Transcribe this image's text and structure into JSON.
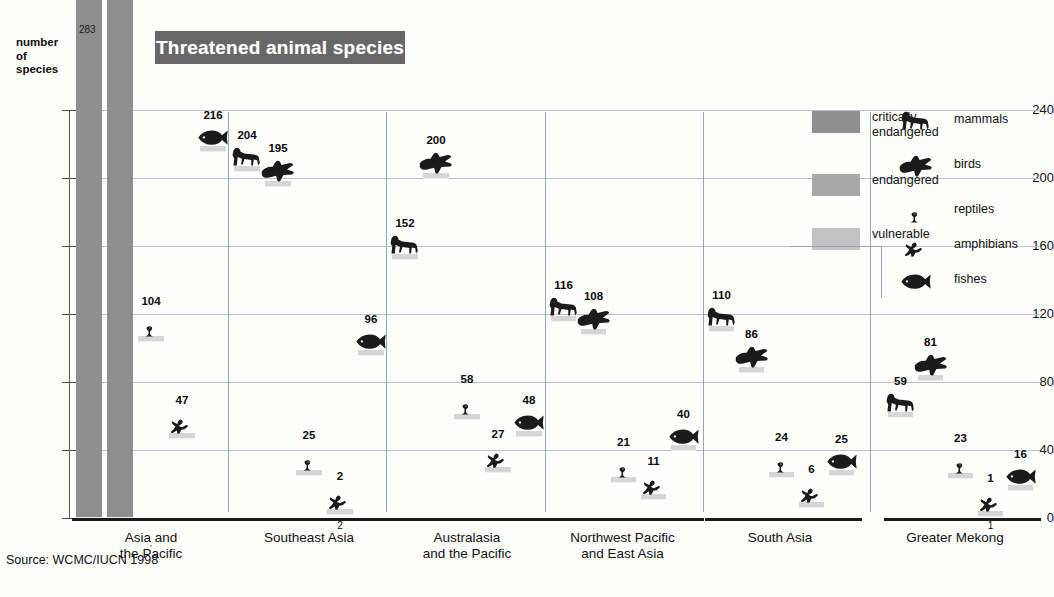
{
  "title": "Threatened animal species",
  "axis": {
    "y_title": "number\nof\nspecies",
    "y_title_lines": [
      "number",
      "of",
      "species"
    ],
    "y_ticks": [
      0,
      40,
      80,
      120,
      160,
      200,
      240
    ],
    "y_min": 0,
    "y_max": 240
  },
  "source": "Source: WCMC/IUCN 1998",
  "legend": {
    "categories": [
      {
        "key": "critically",
        "label": "critically\nendangered",
        "lines": [
          "critically",
          "endangered"
        ],
        "color": "#8e8e8e"
      },
      {
        "key": "endangered",
        "label": "endangered",
        "lines": [
          "endangered"
        ],
        "color": "#a9a9a9"
      },
      {
        "key": "vulnerable",
        "label": "vulnerable",
        "lines": [
          "vulnerable"
        ],
        "color": "#c2c2c2"
      }
    ],
    "taxa": [
      {
        "icon": "mammals-icon",
        "label": "mammals"
      },
      {
        "icon": "birds-icon",
        "label": "birds"
      },
      {
        "icon": "reptiles-icon",
        "label": "reptiles"
      },
      {
        "icon": "amphibians-icon",
        "label": "amphibians"
      },
      {
        "icon": "fishes-icon",
        "label": "fishes"
      }
    ]
  },
  "chart_data": {
    "type": "bar",
    "title": "Threatened animal species",
    "xlabel": "",
    "ylabel": "number of species",
    "ylim": [
      0,
      240
    ],
    "stacked": true,
    "grid": true,
    "legend_position": "right",
    "stack_order_bottom_to_top": [
      "vulnerable",
      "endangered",
      "critically endangered"
    ],
    "series": [
      {
        "name": "critically endangered",
        "color": "#8e8e8e"
      },
      {
        "name": "endangered",
        "color": "#a9a9a9"
      },
      {
        "name": "vulnerable",
        "color": "#c2c2c2"
      }
    ],
    "categories": [
      "Asia and the Pacific",
      "Southeast Asia",
      "Australasia and the Pacific",
      "Northwest Pacific and East Asia",
      "South Asia",
      "Greater Mekong"
    ],
    "taxa": [
      "mammals",
      "birds",
      "reptiles",
      "amphibians",
      "fishes"
    ],
    "groups": [
      {
        "name": "Asia and the Pacific",
        "label_lines": [
          "Asia and",
          "the Pacific"
        ],
        "bars": [
          {
            "taxon": "mammals",
            "total": null,
            "total_label": "",
            "clipped": true,
            "segments": [
              {
                "cat": "critically",
                "value": 283
              }
            ]
          },
          {
            "taxon": "birds",
            "total": null,
            "total_label": "",
            "clipped": true,
            "segments": []
          },
          {
            "taxon": "reptiles",
            "total": 104,
            "total_label": "104",
            "clipped": false,
            "segments": [
              {
                "cat": "critically",
                "value": 13
              },
              {
                "cat": "endangered",
                "value": 24
              },
              {
                "cat": "vulnerable",
                "value": 67
              }
            ]
          },
          {
            "taxon": "amphibians",
            "total": 47,
            "total_label": "47",
            "clipped": false,
            "segments": [
              {
                "cat": "critically",
                "value": 8
              },
              {
                "cat": "endangered",
                "value": 16
              },
              {
                "cat": "vulnerable",
                "value": 23
              }
            ]
          },
          {
            "taxon": "fishes",
            "total": 216,
            "total_label": "216",
            "clipped": false,
            "segments": [
              {
                "cat": "critically",
                "value": 44
              },
              {
                "cat": "endangered",
                "value": 47
              },
              {
                "cat": "vulnerable",
                "value": 125
              }
            ]
          }
        ]
      },
      {
        "name": "Southeast Asia",
        "label_lines": [
          "Southeast Asia"
        ],
        "bars": [
          {
            "taxon": "mammals",
            "total": 204,
            "total_label": "204",
            "clipped": false,
            "segments": [
              {
                "cat": "critically",
                "value": 23
              },
              {
                "cat": "endangered",
                "value": 57
              },
              {
                "cat": "vulnerable",
                "value": 124
              }
            ]
          },
          {
            "taxon": "birds",
            "total": 195,
            "total_label": "195",
            "clipped": false,
            "segments": [
              {
                "cat": "critically",
                "value": 20
              },
              {
                "cat": "endangered",
                "value": 42
              },
              {
                "cat": "vulnerable",
                "value": 133
              }
            ]
          },
          {
            "taxon": "reptiles",
            "total": 25,
            "total_label": "25",
            "clipped": false,
            "segments": [
              {
                "cat": "critically",
                "value": 6
              },
              {
                "cat": "endangered",
                "value": 15
              },
              {
                "cat": "vulnerable",
                "value": 4
              }
            ]
          },
          {
            "taxon": "amphibians",
            "total": 2,
            "total_label": "2",
            "clipped": false,
            "segments": [
              {
                "cat": "vulnerable",
                "value": 2
              }
            ]
          },
          {
            "taxon": "fishes",
            "total": 96,
            "total_label": "96",
            "clipped": false,
            "segments": [
              {
                "cat": "critically",
                "value": 25
              },
              {
                "cat": "endangered",
                "value": 11
              },
              {
                "cat": "vulnerable",
                "value": 60
              }
            ]
          }
        ]
      },
      {
        "name": "Australasia and the Pacific",
        "label_lines": [
          "Australasia",
          "and the Pacific"
        ],
        "bars": [
          {
            "taxon": "mammals",
            "total": 152,
            "total_label": "152",
            "clipped": false,
            "segments": [
              {
                "cat": "critically",
                "value": 23
              },
              {
                "cat": "endangered",
                "value": 40
              },
              {
                "cat": "vulnerable",
                "value": 89
              }
            ]
          },
          {
            "taxon": "birds",
            "total": 200,
            "total_label": "200",
            "clipped": false,
            "segments": [
              {
                "cat": "critically",
                "value": 23
              },
              {
                "cat": "endangered",
                "value": 38
              },
              {
                "cat": "vulnerable",
                "value": 139
              }
            ]
          },
          {
            "taxon": "reptiles",
            "total": 58,
            "total_label": "58",
            "clipped": false,
            "segments": [
              {
                "cat": "critically",
                "value": 4
              },
              {
                "cat": "endangered",
                "value": 12
              },
              {
                "cat": "vulnerable",
                "value": 42
              }
            ]
          },
          {
            "taxon": "amphibians",
            "total": 27,
            "total_label": "27",
            "clipped": false,
            "segments": [
              {
                "cat": "critically",
                "value": 8
              },
              {
                "cat": "endangered",
                "value": 11
              },
              {
                "cat": "vulnerable",
                "value": 8
              }
            ]
          },
          {
            "taxon": "fishes",
            "total": 48,
            "total_label": "48",
            "clipped": false,
            "segments": [
              {
                "cat": "critically",
                "value": 10
              },
              {
                "cat": "endangered",
                "value": 6
              },
              {
                "cat": "vulnerable",
                "value": 32
              }
            ]
          }
        ]
      },
      {
        "name": "Northwest Pacific and East Asia",
        "label_lines": [
          "Northwest Pacific",
          "and East Asia"
        ],
        "bars": [
          {
            "taxon": "mammals",
            "total": 116,
            "total_label": "116",
            "clipped": false,
            "segments": [
              {
                "cat": "critically",
                "value": 9
              },
              {
                "cat": "endangered",
                "value": 44
              },
              {
                "cat": "vulnerable",
                "value": 63
              }
            ]
          },
          {
            "taxon": "birds",
            "total": 108,
            "total_label": "108",
            "clipped": false,
            "segments": [
              {
                "cat": "critically",
                "value": 10
              },
              {
                "cat": "endangered",
                "value": 11
              },
              {
                "cat": "vulnerable",
                "value": 87
              }
            ]
          },
          {
            "taxon": "reptiles",
            "total": 21,
            "total_label": "21",
            "clipped": false,
            "segments": [
              {
                "cat": "critically",
                "value": 3
              },
              {
                "cat": "endangered",
                "value": 6
              },
              {
                "cat": "vulnerable",
                "value": 12
              }
            ]
          },
          {
            "taxon": "amphibians",
            "total": 11,
            "total_label": "11",
            "clipped": false,
            "segments": [
              {
                "cat": "endangered",
                "value": 3
              },
              {
                "cat": "vulnerable",
                "value": 8
              }
            ]
          },
          {
            "taxon": "fishes",
            "total": 40,
            "total_label": "40",
            "clipped": false,
            "segments": [
              {
                "cat": "critically",
                "value": 3
              },
              {
                "cat": "endangered",
                "value": 17
              },
              {
                "cat": "vulnerable",
                "value": 20
              }
            ]
          }
        ]
      },
      {
        "name": "South Asia",
        "label_lines": [
          "South Asia"
        ],
        "bars": [
          {
            "taxon": "mammals",
            "total": 110,
            "total_label": "110",
            "clipped": false,
            "segments": [
              {
                "cat": "critically",
                "value": 11
              },
              {
                "cat": "endangered",
                "value": 38
              },
              {
                "cat": "vulnerable",
                "value": 61
              }
            ]
          },
          {
            "taxon": "birds",
            "total": 86,
            "total_label": "86",
            "clipped": false,
            "segments": [
              {
                "cat": "critically",
                "value": 5
              },
              {
                "cat": "endangered",
                "value": 11
              },
              {
                "cat": "vulnerable",
                "value": 70
              }
            ]
          },
          {
            "taxon": "reptiles",
            "total": 24,
            "total_label": "24",
            "clipped": false,
            "segments": [
              {
                "cat": "critically",
                "value": 2
              },
              {
                "cat": "endangered",
                "value": 12
              },
              {
                "cat": "vulnerable",
                "value": 10
              }
            ]
          },
          {
            "taxon": "amphibians",
            "total": 6,
            "total_label": "6",
            "clipped": false,
            "segments": [
              {
                "cat": "endangered",
                "value": 2
              },
              {
                "cat": "vulnerable",
                "value": 4
              }
            ]
          },
          {
            "taxon": "fishes",
            "total": 25,
            "total_label": "25",
            "clipped": false,
            "segments": [
              {
                "cat": "critically",
                "value": 4
              },
              {
                "cat": "endangered",
                "value": 14
              },
              {
                "cat": "vulnerable",
                "value": 7
              }
            ]
          }
        ]
      },
      {
        "name": "Greater Mekong",
        "label_lines": [
          "Greater Mekong"
        ],
        "bars": [
          {
            "taxon": "mammals",
            "total": 59,
            "total_label": "59",
            "clipped": false,
            "segments": [
              {
                "cat": "critically",
                "value": 10
              },
              {
                "cat": "endangered",
                "value": 18
              },
              {
                "cat": "vulnerable",
                "value": 31
              }
            ]
          },
          {
            "taxon": "birds",
            "total": 81,
            "total_label": "81",
            "clipped": false,
            "segments": [
              {
                "cat": "critically",
                "value": 11
              },
              {
                "cat": "endangered",
                "value": 12
              },
              {
                "cat": "vulnerable",
                "value": 58
              }
            ]
          },
          {
            "taxon": "reptiles",
            "total": 23,
            "total_label": "23",
            "clipped": false,
            "segments": [
              {
                "cat": "critically",
                "value": 6
              },
              {
                "cat": "endangered",
                "value": 7
              },
              {
                "cat": "vulnerable",
                "value": 10
              }
            ]
          },
          {
            "taxon": "amphibians",
            "total": 1,
            "total_label": "1",
            "clipped": false,
            "segments": [
              {
                "cat": "vulnerable",
                "value": 1
              }
            ]
          },
          {
            "taxon": "fishes",
            "total": 16,
            "total_label": "16",
            "clipped": false,
            "segments": [
              {
                "cat": "critically",
                "value": 2
              },
              {
                "cat": "endangered",
                "value": 6
              },
              {
                "cat": "vulnerable",
                "value": 8
              }
            ]
          }
        ]
      }
    ]
  }
}
